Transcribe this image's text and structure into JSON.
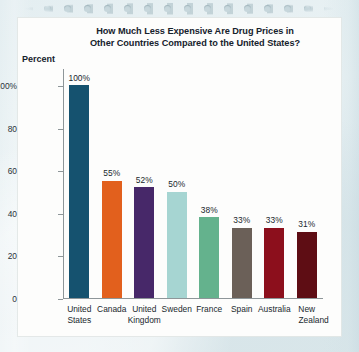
{
  "figure": {
    "background_color": "#e7f0f2",
    "card_color": "#fdfdfc",
    "axis_color": "#8e9699",
    "text_color": "#20282d"
  },
  "chart_data": {
    "type": "bar",
    "title": "How Much Less Expensive Are Drug Prices in Other Countries Compared to the United States?",
    "title_line1": "How Much Less Expensive Are Drug Prices in",
    "title_line2": "Other Countries Compared to the United States?",
    "xlabel": "",
    "ylabel": "Percent",
    "ylim": [
      0,
      100
    ],
    "grid": false,
    "legend": null,
    "ytick_labels": [
      "100%",
      "80",
      "60",
      "40",
      "20",
      "0"
    ],
    "ytick_values": [
      100,
      80,
      60,
      40,
      20,
      0
    ],
    "categories": [
      "United States",
      "Canada",
      "United Kingdom",
      "Sweden",
      "France",
      "Spain",
      "Australia",
      "New Zealand"
    ],
    "category_lines": [
      {
        "line1": "United",
        "line2": "States",
        "align": "center"
      },
      {
        "line1": "Canada",
        "line2": "",
        "align": "center"
      },
      {
        "line1": "United",
        "line2": "Kingdom",
        "align": "center"
      },
      {
        "line1": "Sweden",
        "line2": "",
        "align": "center"
      },
      {
        "line1": "France",
        "line2": "",
        "align": "center"
      },
      {
        "line1": "Spain",
        "line2": "",
        "align": "center"
      },
      {
        "line1": "Australia",
        "line2": "",
        "align": "center"
      },
      {
        "line1": "New",
        "line2": "Zealand",
        "align": "right"
      }
    ],
    "values": [
      100,
      55,
      52,
      50,
      38,
      33,
      33,
      31
    ],
    "value_labels": [
      "100%",
      "55%",
      "52%",
      "50%",
      "38%",
      "33%",
      "33%",
      "31%"
    ],
    "colors": [
      "#15526f",
      "#e2601d",
      "#472869",
      "#a6d5d2",
      "#64b28d",
      "#6b6058",
      "#8c0f1c",
      "#5e0d14"
    ]
  }
}
